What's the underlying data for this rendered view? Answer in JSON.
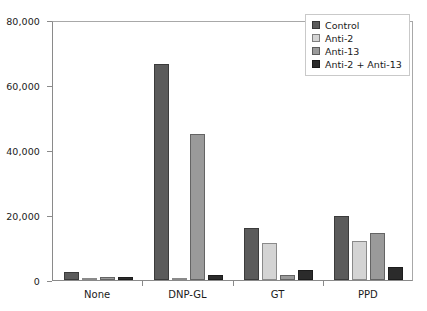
{
  "chart_data": {
    "type": "bar",
    "title": "",
    "xlabel": "",
    "ylabel": "",
    "ylim": [
      0,
      80000
    ],
    "ytick_labels": [
      "0",
      "20,000",
      "40,000",
      "60,000",
      "80,000"
    ],
    "yticks": [
      0,
      20000,
      40000,
      60000,
      80000
    ],
    "grid": false,
    "legend_position": "top-right",
    "categories": [
      "None",
      "DNP-GL",
      "GT",
      "PPD"
    ],
    "series": [
      {
        "name": "Control",
        "color": "#5b5b5b",
        "values": [
          2500,
          66500,
          16000,
          19700
        ]
      },
      {
        "name": "Anti-2",
        "color": "#d4d4d4",
        "values": [
          700,
          600,
          11500,
          12000
        ]
      },
      {
        "name": "Anti-13",
        "color": "#9a9a9a",
        "values": [
          800,
          45000,
          1500,
          14600
        ]
      },
      {
        "name": "Anti-2 + Anti-13",
        "color": "#2b2b2b",
        "values": [
          900,
          1600,
          3000,
          3900
        ]
      }
    ]
  },
  "legend": {
    "items": [
      {
        "label": "Control",
        "color": "#5b5b5b"
      },
      {
        "label": "Anti-2",
        "color": "#d4d4d4"
      },
      {
        "label": "Anti-13",
        "color": "#9a9a9a"
      },
      {
        "label": "Anti-2 + Anti-13",
        "color": "#2b2b2b"
      }
    ]
  },
  "axis": {
    "y_labels": [
      "80,000",
      "60,000",
      "40,000",
      "20,000",
      "0"
    ],
    "x_labels": [
      "None",
      "DNP-GL",
      "GT",
      "PPD"
    ]
  },
  "colors": {
    "axis_line": "#8a8a8a",
    "frame_line": "#a8a8a8",
    "text": "#1a1a1a",
    "background": "#ffffff"
  }
}
